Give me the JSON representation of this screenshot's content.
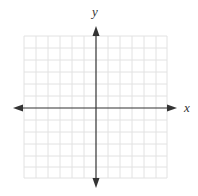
{
  "diagram": {
    "type": "coordinate-plane",
    "x_axis_label": "x",
    "y_axis_label": "y",
    "grid": {
      "cells_left_of_y_axis": 6,
      "cells_right_of_y_axis": 6,
      "cells_above_x_axis": 6,
      "cells_below_x_axis": 6,
      "color": "#e2e2e2"
    },
    "axis_color": "#333333",
    "arrows": [
      "left",
      "right",
      "up",
      "down"
    ]
  }
}
